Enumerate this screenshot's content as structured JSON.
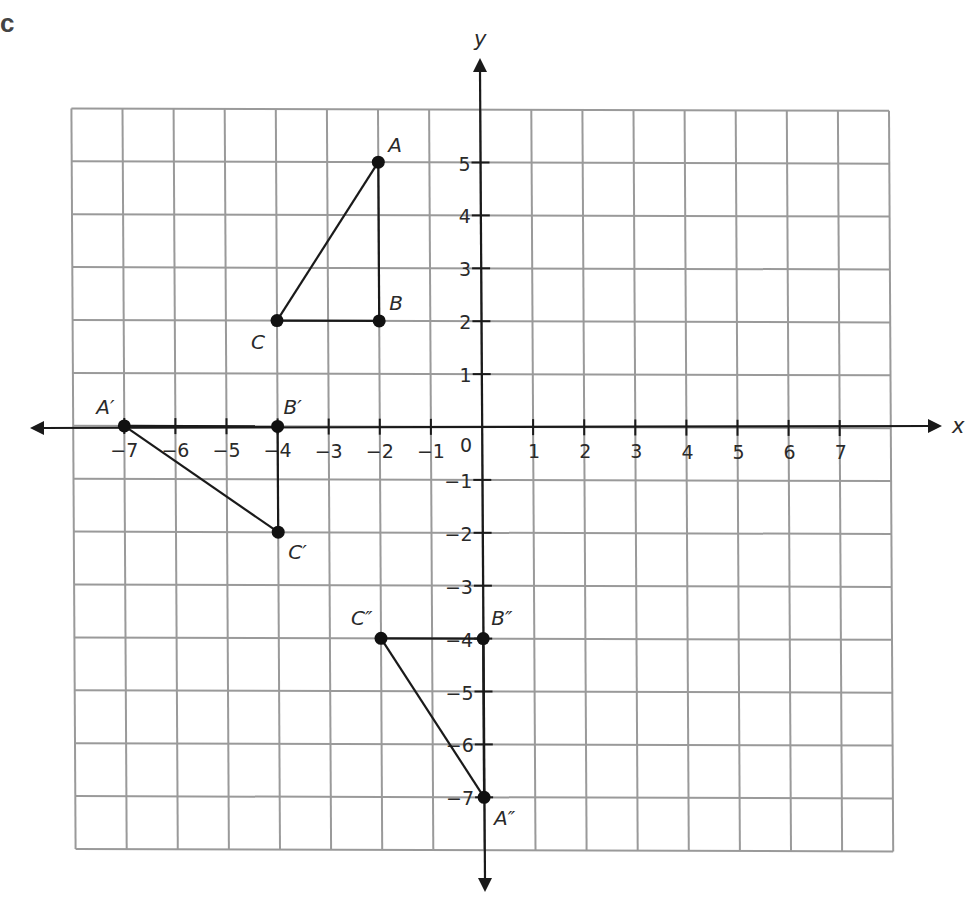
{
  "figure_label": "c",
  "axes": {
    "x_name": "x",
    "y_name": "y",
    "x_ticks": [
      -7,
      -6,
      -5,
      -4,
      -3,
      -2,
      -1,
      1,
      2,
      3,
      4,
      5,
      6,
      7
    ],
    "y_ticks": [
      5,
      4,
      3,
      2,
      1,
      -1,
      -2,
      -3,
      -4,
      -5,
      -6,
      -7
    ],
    "origin_label": "0",
    "grid_x_range": [
      -8,
      8
    ],
    "grid_y_range": [
      -8,
      6
    ]
  },
  "colors": {
    "grid": "#9a9a9a",
    "axis": "#1a1a1a",
    "point": "#111111"
  },
  "chart_data": {
    "type": "scatter",
    "title": "",
    "xlabel": "x",
    "ylabel": "y",
    "xlim": [
      -8,
      8
    ],
    "ylim": [
      -8,
      6
    ],
    "grid": true,
    "shapes": [
      {
        "name": "Triangle ABC",
        "vertices": [
          {
            "label": "A",
            "x": -2,
            "y": 5
          },
          {
            "label": "B",
            "x": -2,
            "y": 2
          },
          {
            "label": "C",
            "x": -4,
            "y": 2
          }
        ]
      },
      {
        "name": "Triangle A'B'C'",
        "vertices": [
          {
            "label": "A′",
            "x": -7,
            "y": 0
          },
          {
            "label": "B′",
            "x": -4,
            "y": 0
          },
          {
            "label": "C′",
            "x": -4,
            "y": -2
          }
        ]
      },
      {
        "name": "Triangle A''B''C''",
        "vertices": [
          {
            "label": "A″",
            "x": 0,
            "y": -7
          },
          {
            "label": "B″",
            "x": 0,
            "y": -4
          },
          {
            "label": "C″",
            "x": -2,
            "y": -4
          }
        ]
      }
    ]
  }
}
